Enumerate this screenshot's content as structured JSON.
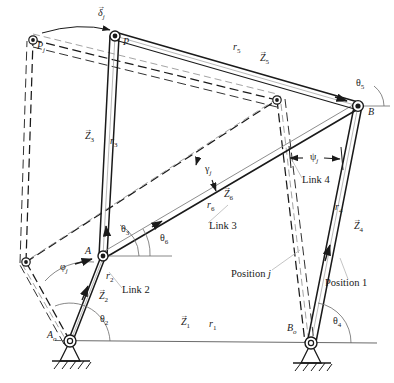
{
  "figure": {
    "type": "kinematic-linkage-diagram",
    "line_color": "#1a1a1a",
    "dashed_color": "#1a1a1a",
    "leader_color": "#b9b9b9",
    "ground_color": "#555555"
  },
  "joints": [
    {
      "name": "A0",
      "label": "A",
      "sub": "o",
      "x": 70,
      "y": 341,
      "kind": "ground-pivot"
    },
    {
      "name": "B0",
      "label": "B",
      "sub": "o",
      "x": 311,
      "y": 343,
      "kind": "ground-pivot"
    },
    {
      "name": "A",
      "label": "A",
      "sub": "",
      "x": 103,
      "y": 256,
      "kind": "pin"
    },
    {
      "name": "B",
      "label": "B",
      "sub": "",
      "x": 358,
      "y": 106,
      "kind": "pin"
    },
    {
      "name": "P",
      "label": "P",
      "sub": "",
      "x": 115,
      "y": 36,
      "kind": "pin"
    },
    {
      "name": "Aj",
      "label": "",
      "sub": "",
      "x": 26,
      "y": 262,
      "kind": "pin-dashed"
    },
    {
      "name": "Pj",
      "label": "P",
      "sub": "j",
      "x": 33,
      "y": 40,
      "kind": "pin-dashed"
    },
    {
      "name": "Cj",
      "label": "",
      "sub": "",
      "x": 277,
      "y": 100,
      "kind": "pin-dashed"
    }
  ],
  "labels": {
    "delta_j": {
      "text": "δ",
      "sub": "j",
      "vector": true,
      "x": 100,
      "y": 12
    },
    "P": {
      "text": "P",
      "sub": "",
      "vector": false,
      "x": 123,
      "y": 42
    },
    "Pj": {
      "text": "P",
      "sub": "j",
      "vector": false,
      "x": 37,
      "y": 46
    },
    "r5": {
      "text": "r",
      "sub": "5",
      "vector": false,
      "x": 233,
      "y": 47
    },
    "Z5": {
      "text": "Z",
      "sub": "5",
      "vector": true,
      "x": 260,
      "y": 57
    },
    "theta5": {
      "text": "θ",
      "sub": "5",
      "vector": false,
      "x": 358,
      "y": 82
    },
    "B": {
      "text": "B",
      "sub": "",
      "vector": false,
      "x": 368,
      "y": 110
    },
    "Z3": {
      "text": "Z",
      "sub": "3",
      "vector": true,
      "x": 87,
      "y": 136
    },
    "r3": {
      "text": "r",
      "sub": "3",
      "vector": false,
      "x": 111,
      "y": 140
    },
    "gamma_j": {
      "text": "γ",
      "sub": "j",
      "vector": false,
      "x": 205,
      "y": 168
    },
    "psi_j": {
      "text": "ψ",
      "sub": "j",
      "vector": false,
      "x": 311,
      "y": 159
    },
    "Link4": {
      "text": "Link 4",
      "sub": "",
      "vector": false,
      "x": 303,
      "y": 180
    },
    "Z6": {
      "text": "Z",
      "sub": "6",
      "vector": true,
      "x": 224,
      "y": 193
    },
    "r6": {
      "text": "r",
      "sub": "6",
      "vector": false,
      "x": 208,
      "y": 204
    },
    "r4": {
      "text": "r",
      "sub": "4",
      "vector": false,
      "x": 336,
      "y": 206
    },
    "Z4": {
      "text": "Z",
      "sub": "4",
      "vector": true,
      "x": 356,
      "y": 226
    },
    "Link3": {
      "text": "Link 3",
      "sub": "",
      "vector": false,
      "x": 210,
      "y": 226
    },
    "theta3": {
      "text": "θ",
      "sub": "3",
      "vector": false,
      "x": 122,
      "y": 228
    },
    "theta6": {
      "text": "θ",
      "sub": "6",
      "vector": false,
      "x": 161,
      "y": 237
    },
    "A": {
      "text": "A",
      "sub": "",
      "vector": false,
      "x": 85,
      "y": 250
    },
    "phi_j": {
      "text": "φ",
      "sub": "j",
      "vector": false,
      "x": 62,
      "y": 267
    },
    "r2": {
      "text": "r",
      "sub": "2",
      "vector": false,
      "x": 107,
      "y": 275
    },
    "Position_j": {
      "text": "Position ",
      "sub": "",
      "italicTail": "j",
      "vector": false,
      "x": 231,
      "y": 274
    },
    "Z2": {
      "text": "Z",
      "sub": "2",
      "vector": true,
      "x": 100,
      "y": 295
    },
    "Link2": {
      "text": "Link 2",
      "sub": "",
      "vector": false,
      "x": 123,
      "y": 290
    },
    "Position_1": {
      "text": "Position 1",
      "sub": "",
      "vector": false,
      "x": 325,
      "y": 283
    },
    "theta2": {
      "text": "θ",
      "sub": "2",
      "vector": false,
      "x": 101,
      "y": 318
    },
    "Z1": {
      "text": "Z",
      "sub": "1",
      "vector": true,
      "x": 182,
      "y": 322
    },
    "r1": {
      "text": "r",
      "sub": "1",
      "vector": false,
      "x": 210,
      "y": 323
    },
    "theta4": {
      "text": "θ",
      "sub": "4",
      "vector": false,
      "x": 334,
      "y": 320
    },
    "A0": {
      "text": "A",
      "sub": "o",
      "vector": false,
      "x": 48,
      "y": 334
    },
    "B0": {
      "text": "B",
      "sub": "o",
      "vector": false,
      "x": 288,
      "y": 327
    }
  },
  "position_1": {
    "name": "Position 1 (solid lines)",
    "links": [
      {
        "name": "link2-A0-A",
        "from": [
          70,
          341
        ],
        "to": [
          103,
          256
        ],
        "width": 5
      },
      {
        "name": "link3-A-P",
        "from": [
          103,
          256
        ],
        "to": [
          115,
          36
        ],
        "width": 5
      },
      {
        "name": "link3-A-B",
        "from": [
          103,
          256
        ],
        "to": [
          358,
          106
        ],
        "width": 4
      },
      {
        "name": "link5-P-B",
        "from": [
          115,
          36
        ],
        "to": [
          358,
          106
        ],
        "width": 5
      },
      {
        "name": "link4-B-B0",
        "from": [
          358,
          106
        ],
        "to": [
          311,
          343
        ],
        "width": 5
      }
    ]
  },
  "position_j": {
    "name": "Position j (dashed lines)",
    "links": [
      {
        "name": "link2j-A0-Aj",
        "from": [
          70,
          341
        ],
        "to": [
          26,
          262
        ]
      },
      {
        "name": "link3j-Aj-Pj",
        "from": [
          26,
          262
        ],
        "to": [
          33,
          40
        ]
      },
      {
        "name": "link3j-Aj-Cj",
        "from": [
          26,
          262
        ],
        "to": [
          277,
          100
        ]
      },
      {
        "name": "link5j-Pj-Cj",
        "from": [
          33,
          40
        ],
        "to": [
          277,
          100
        ]
      },
      {
        "name": "link4j-Cj-B0",
        "from": [
          277,
          100
        ],
        "to": [
          311,
          343
        ]
      }
    ]
  },
  "ground_line": {
    "name": "ground-reference-line",
    "from": [
      55,
      340
    ],
    "to": [
      375,
      343
    ]
  },
  "angle_arcs": [
    {
      "name": "theta2-arc",
      "cx": 70,
      "cy": 341,
      "r": 40,
      "a1": 180,
      "a2": 249
    },
    {
      "name": "theta3-arc",
      "cx": 103,
      "cy": 256,
      "r": 36,
      "a1": 180,
      "a2": 267
    },
    {
      "name": "theta6-arc",
      "cx": 103,
      "cy": 256,
      "r": 64,
      "a1": 180,
      "a2": 210
    },
    {
      "name": "theta4-arc",
      "cx": 311,
      "cy": 343,
      "r": 40,
      "a1": 0,
      "a2": 281
    },
    {
      "name": "theta5-arc",
      "cx": 358,
      "cy": 106,
      "r": 26,
      "a1": 0,
      "a2": 196
    }
  ]
}
